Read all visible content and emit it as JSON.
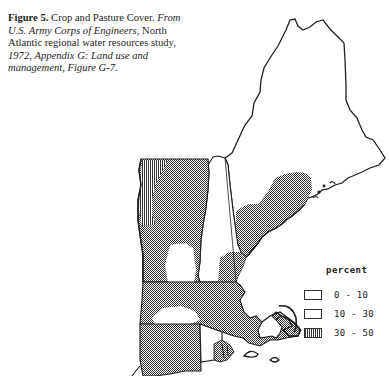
{
  "caption": {
    "figure_label": "Figure 5.",
    "title": " Crop and Pasture Cover.",
    "source_italic_1": "From U.S. Army Corps of Engineers",
    "source_plain_1": ", North Atlantic regional water resources study, ",
    "year": "1972",
    "source_plain_2": ", ",
    "source_italic_2": "Appendix G: Land use and management",
    "source_plain_3": ", ",
    "source_italic_3": "Figure G-7",
    "end": "."
  },
  "map": {
    "region": "New England",
    "states": [
      {
        "name": "Maine",
        "classes": [
          "0-10",
          "10-30"
        ]
      },
      {
        "name": "New Hampshire",
        "classes": [
          "0-10",
          "10-30"
        ]
      },
      {
        "name": "Vermont",
        "classes": [
          "10-30",
          "30-50"
        ]
      },
      {
        "name": "Massachusetts",
        "classes": [
          "10-30",
          "0-10"
        ]
      },
      {
        "name": "Connecticut",
        "classes": [
          "10-30"
        ]
      },
      {
        "name": "Rhode Island",
        "classes": [
          "0-10",
          "10-30"
        ]
      }
    ]
  },
  "legend": {
    "title": "percent",
    "items": [
      {
        "label": "0 - 10",
        "pattern": "blank"
      },
      {
        "label": "10 - 30",
        "pattern": "stipple"
      },
      {
        "label": "30 - 50",
        "pattern": "vertical-hatch"
      }
    ]
  },
  "colors": {
    "ink": "#1e1e1e",
    "paper": "#ffffff"
  }
}
